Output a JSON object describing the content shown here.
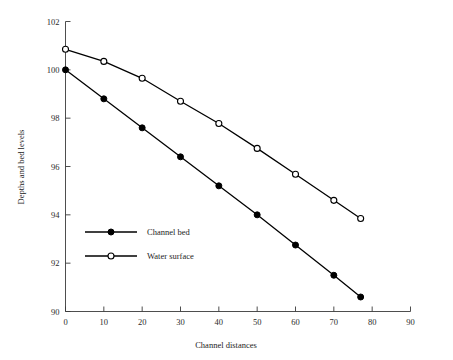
{
  "chart_data": {
    "type": "line",
    "title": "",
    "xlabel": "Channel distances",
    "ylabel": "Depths and bed levels",
    "xlim": [
      0,
      90
    ],
    "ylim": [
      90,
      102
    ],
    "xticks": [
      0,
      10,
      20,
      30,
      40,
      50,
      60,
      70,
      80,
      90
    ],
    "yticks": [
      90,
      92,
      94,
      96,
      98,
      100,
      102
    ],
    "grid": false,
    "legend_position": "center-left",
    "series": [
      {
        "name": "Channel bed",
        "marker": "filled-circle",
        "color": "#000000",
        "x": [
          0,
          10,
          20,
          30,
          40,
          50,
          60,
          70,
          77
        ],
        "values": [
          100.0,
          98.8,
          97.6,
          96.4,
          95.2,
          94.0,
          92.75,
          91.5,
          90.6
        ]
      },
      {
        "name": "Water surface",
        "marker": "open-circle",
        "color": "#000000",
        "x": [
          0,
          10,
          20,
          30,
          40,
          50,
          60,
          70,
          77
        ],
        "values": [
          100.85,
          100.35,
          99.65,
          98.7,
          97.78,
          96.75,
          95.68,
          94.6,
          93.85
        ]
      }
    ]
  },
  "axes": {
    "y_title": "Depths and bed levels",
    "x_title": "Channel distances",
    "y_tick_labels": [
      "102",
      "100",
      "98",
      "96",
      "94",
      "92",
      "90"
    ],
    "x_tick_labels": [
      "0",
      "10",
      "20",
      "30",
      "40",
      "50",
      "60",
      "70",
      "80",
      "90"
    ]
  },
  "legend": {
    "entries": [
      {
        "label": "Channel bed",
        "marker": "filled-circle-marker"
      },
      {
        "label": "Water surface",
        "marker": "open-circle-marker"
      }
    ]
  }
}
